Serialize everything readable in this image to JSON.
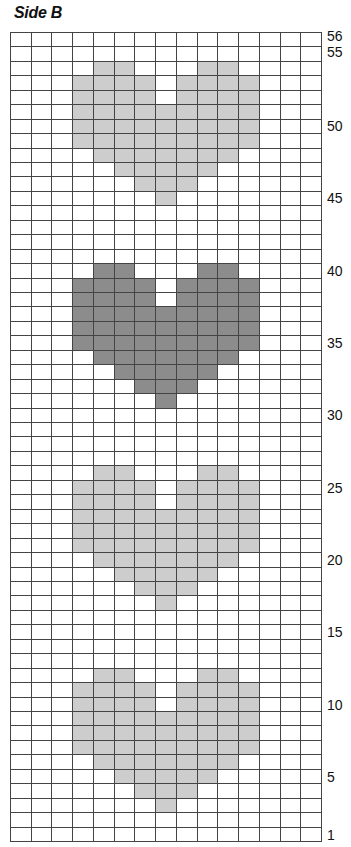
{
  "title": "Side B",
  "grid": {
    "columns": 15,
    "rows": 56,
    "colors": {
      "empty": "#ffffff",
      "light": "#cdcdcd",
      "dark": "#8c8c8c",
      "gridline": "#444444"
    }
  },
  "hearts": [
    {
      "name": "heart-top",
      "color": "light",
      "top_row": 54
    },
    {
      "name": "heart-dark",
      "color": "dark",
      "top_row": 40
    },
    {
      "name": "heart-third",
      "color": "light",
      "top_row": 26
    },
    {
      "name": "heart-bottom",
      "color": "light",
      "top_row": 12
    }
  ],
  "heart_shape": [
    [
      4,
      5,
      9,
      10
    ],
    [
      3,
      4,
      5,
      6,
      8,
      9,
      10,
      11
    ],
    [
      3,
      4,
      5,
      6,
      8,
      9,
      10,
      11
    ],
    [
      3,
      4,
      5,
      6,
      7,
      8,
      9,
      10,
      11
    ],
    [
      3,
      4,
      5,
      6,
      7,
      8,
      9,
      10,
      11
    ],
    [
      3,
      4,
      5,
      6,
      7,
      8,
      9,
      10,
      11
    ],
    [
      4,
      5,
      6,
      7,
      8,
      9,
      10
    ],
    [
      5,
      6,
      7,
      8,
      9
    ],
    [
      6,
      7,
      8
    ],
    [
      7
    ]
  ],
  "row_labels": [
    {
      "row": 56,
      "text": "56"
    },
    {
      "row": 55,
      "text": "55"
    },
    {
      "row": 50,
      "text": "50"
    },
    {
      "row": 45,
      "text": "45"
    },
    {
      "row": 40,
      "text": "40"
    },
    {
      "row": 35,
      "text": "35"
    },
    {
      "row": 30,
      "text": "30"
    },
    {
      "row": 25,
      "text": "25"
    },
    {
      "row": 20,
      "text": "20"
    },
    {
      "row": 15,
      "text": "15"
    },
    {
      "row": 10,
      "text": "10"
    },
    {
      "row": 5,
      "text": "5"
    },
    {
      "row": 1,
      "text": "1"
    }
  ]
}
